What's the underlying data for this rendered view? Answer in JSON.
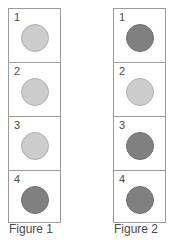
{
  "diagram": {
    "background_color": "#ffffff",
    "border_color": "#9a9a9a",
    "light_fill": "#cccccc",
    "dark_fill": "#808080",
    "text_color": "#4a4a4a",
    "figures": [
      {
        "caption": "Figure 1",
        "cells": [
          {
            "number": "1",
            "shade": "light"
          },
          {
            "number": "2",
            "shade": "light"
          },
          {
            "number": "3",
            "shade": "light"
          },
          {
            "number": "4",
            "shade": "dark"
          }
        ]
      },
      {
        "caption": "Figure 2",
        "cells": [
          {
            "number": "1",
            "shade": "dark"
          },
          {
            "number": "2",
            "shade": "light"
          },
          {
            "number": "3",
            "shade": "dark"
          },
          {
            "number": "4",
            "shade": "dark"
          }
        ]
      }
    ]
  }
}
